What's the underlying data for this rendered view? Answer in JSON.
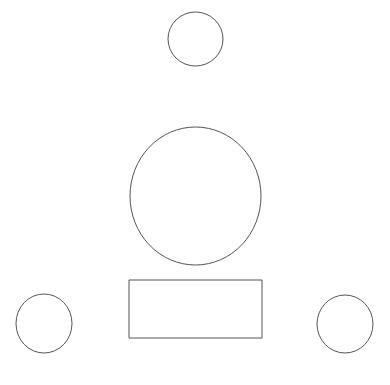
{
  "canvas": {
    "width": 390,
    "height": 385,
    "background_color": "#ffffff",
    "stroke_color": "#555558",
    "stroke_width": 1,
    "fill": "none"
  },
  "diagram": {
    "type": "line-drawing",
    "shape_count": 5,
    "shapes": [
      {
        "id": "circle-top-small",
        "name": "small-circle-top",
        "kind": "ellipse",
        "cx": 195.5,
        "cy": 39,
        "rx": 27.5,
        "ry": 27,
        "bbox": {
          "x": 168,
          "y": 12,
          "width": 55,
          "height": 54
        }
      },
      {
        "id": "circle-center-large",
        "name": "large-circle-center",
        "kind": "ellipse",
        "cx": 195.5,
        "cy": 196,
        "rx": 65.5,
        "ry": 69,
        "bbox": {
          "x": 130,
          "y": 127,
          "width": 131,
          "height": 138
        }
      },
      {
        "id": "rect-bottom-center",
        "name": "rectangle-bottom-center",
        "kind": "rectangle",
        "bbox": {
          "x": 129,
          "y": 280,
          "width": 133,
          "height": 58
        }
      },
      {
        "id": "circle-bottom-left",
        "name": "small-circle-bottom-left",
        "kind": "ellipse",
        "cx": 44,
        "cy": 323.5,
        "rx": 28,
        "ry": 29.5,
        "bbox": {
          "x": 16,
          "y": 294,
          "width": 56,
          "height": 59
        }
      },
      {
        "id": "circle-bottom-right",
        "name": "small-circle-bottom-right",
        "kind": "ellipse",
        "cx": 345,
        "cy": 324,
        "rx": 28,
        "ry": 29,
        "bbox": {
          "x": 317,
          "y": 295,
          "width": 56,
          "height": 58
        }
      }
    ]
  }
}
